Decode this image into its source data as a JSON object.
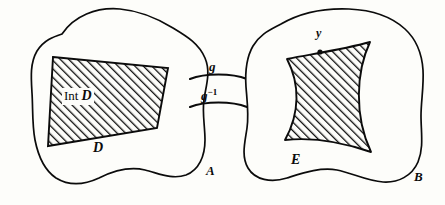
{
  "figure": {
    "kind": "mathematical-diagram",
    "background_color": "#fdfdfa",
    "ink_color": "#0b0b0b"
  },
  "sets": {
    "left": {
      "label": "A",
      "region_label": "D",
      "interior_label_roman": "Int",
      "interior_label_italic": "D"
    },
    "right": {
      "label": "B",
      "region_label": "E",
      "point_label": "y"
    }
  },
  "maps": {
    "forward": "g",
    "inverse_base": "g",
    "inverse_exponent": "−1"
  }
}
